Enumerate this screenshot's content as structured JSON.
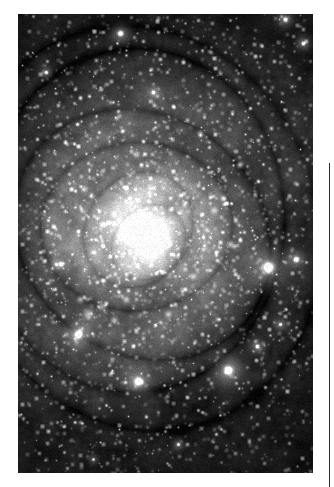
{
  "page": {
    "background_color": "#ffffff",
    "width": 334,
    "height": 487
  },
  "column_rule": {
    "name": "vertical column rule",
    "color": "#2a2a2a",
    "x": 329,
    "y_start": 163,
    "y_end": 487
  },
  "plate": {
    "caption": "",
    "kind": "astronomical photograph",
    "subject": "spiral galaxy",
    "border_color": "#000000",
    "frame": {
      "x": 18,
      "y": 14,
      "width": 295,
      "height": 459
    },
    "palette": {
      "sky": "#050505",
      "disk_mid": "#6b6b6b",
      "core_halo": "#b9b9b9",
      "star_white": "#ffffff"
    },
    "galaxy": {
      "nucleus": {
        "x": 134,
        "y": 226,
        "radius": 6,
        "brightness": 1.0
      },
      "halo": {
        "cx": 128,
        "cy": 222,
        "rx": 150,
        "ry": 140,
        "angle_deg": -28
      },
      "disk": {
        "cx": 120,
        "cy": 215,
        "rx": 205,
        "ry": 190,
        "angle_deg": -28
      },
      "arm_count": 4,
      "dust_lanes": 6
    },
    "bright_stars": [
      {
        "name": "star-top-center",
        "x": 102,
        "y": 19,
        "r": 3.0,
        "i": 0.95
      },
      {
        "name": "star-upper-right-a",
        "x": 267,
        "y": 5,
        "r": 2.4,
        "i": 0.9
      },
      {
        "name": "star-upper-left",
        "x": 28,
        "y": 58,
        "r": 1.8,
        "i": 0.75
      },
      {
        "name": "star-mid-upper",
        "x": 135,
        "y": 78,
        "r": 2.0,
        "i": 0.8
      },
      {
        "name": "star-right-upper",
        "x": 285,
        "y": 29,
        "r": 2.2,
        "i": 0.85
      },
      {
        "name": "star-right-bright",
        "x": 250,
        "y": 253,
        "r": 5.5,
        "i": 1.0
      },
      {
        "name": "star-right-knot",
        "x": 278,
        "y": 245,
        "r": 3.0,
        "i": 0.9
      },
      {
        "name": "star-left-bright",
        "x": 60,
        "y": 320,
        "r": 4.0,
        "i": 0.98
      },
      {
        "name": "star-lower-center",
        "x": 120,
        "y": 367,
        "r": 4.2,
        "i": 0.98
      },
      {
        "name": "star-lower-right",
        "x": 210,
        "y": 356,
        "r": 4.5,
        "i": 0.98
      },
      {
        "name": "star-lower-right-small",
        "x": 239,
        "y": 332,
        "r": 2.2,
        "i": 0.85
      },
      {
        "name": "star-right-faint",
        "x": 262,
        "y": 310,
        "r": 1.8,
        "i": 0.7
      },
      {
        "name": "star-left-mid",
        "x": 38,
        "y": 250,
        "r": 1.8,
        "i": 0.7
      },
      {
        "name": "star-bottom-a",
        "x": 160,
        "y": 430,
        "r": 1.8,
        "i": 0.7
      },
      {
        "name": "star-bottom-b",
        "x": 75,
        "y": 445,
        "r": 1.6,
        "i": 0.65
      }
    ],
    "hii_knots": [
      {
        "x": 70,
        "y": 300,
        "r": 3.0
      },
      {
        "x": 84,
        "y": 292,
        "r": 2.4
      },
      {
        "x": 96,
        "y": 306,
        "r": 2.2
      },
      {
        "x": 62,
        "y": 285,
        "r": 2.0
      },
      {
        "x": 108,
        "y": 285,
        "r": 2.0
      },
      {
        "x": 196,
        "y": 196,
        "r": 2.2
      },
      {
        "x": 205,
        "y": 184,
        "r": 2.0
      },
      {
        "x": 212,
        "y": 230,
        "r": 2.2
      },
      {
        "x": 175,
        "y": 262,
        "r": 2.0
      },
      {
        "x": 150,
        "y": 300,
        "r": 2.0
      },
      {
        "x": 84,
        "y": 210,
        "r": 2.0
      },
      {
        "x": 66,
        "y": 175,
        "r": 2.0
      },
      {
        "x": 118,
        "y": 140,
        "r": 2.0
      },
      {
        "x": 182,
        "y": 120,
        "r": 2.0
      },
      {
        "x": 222,
        "y": 150,
        "r": 2.0
      }
    ],
    "star_field": {
      "faint_count": 5200,
      "grain_opacity": 0.5
    }
  }
}
